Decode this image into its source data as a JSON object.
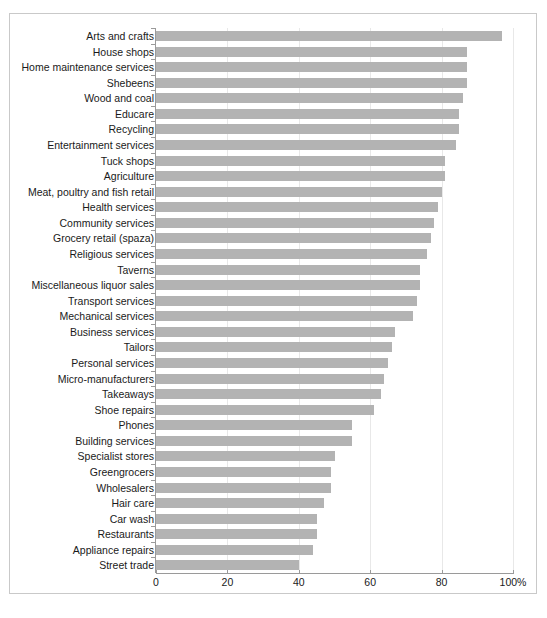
{
  "chart_data": {
    "type": "bar",
    "orientation": "horizontal",
    "title": "",
    "subtitle": "",
    "xlabel": "",
    "ylabel": "",
    "xlim": [
      0,
      100
    ],
    "grid": true,
    "legend": null,
    "bar_color": "#b3b3b3",
    "axis_color": "#9a9a9a",
    "gridline_color": "#e8e8e8",
    "frame_color": "#c9c9c9",
    "xticks": [
      {
        "value": 0,
        "label": "0"
      },
      {
        "value": 20,
        "label": "20"
      },
      {
        "value": 40,
        "label": "40"
      },
      {
        "value": 60,
        "label": "60"
      },
      {
        "value": 80,
        "label": "80"
      },
      {
        "value": 100,
        "label": "100%"
      }
    ],
    "categories": [
      "Arts and crafts",
      "House shops",
      "Home maintenance services",
      "Shebeens",
      "Wood and coal",
      "Educare",
      "Recycling",
      "Entertainment services",
      "Tuck shops",
      "Agriculture",
      "Meat, poultry and fish retail",
      "Health services",
      "Community services",
      "Grocery retail (spaza)",
      "Religious services",
      "Taverns",
      "Miscellaneous liquor sales",
      "Transport services",
      "Mechanical services",
      "Business services",
      "Tailors",
      "Personal services",
      "Micro-manufacturers",
      "Takeaways",
      "Shoe repairs",
      "Phones",
      "Building services",
      "Specialist stores",
      "Greengrocers",
      "Wholesalers",
      "Hair care",
      "Car wash",
      "Restaurants",
      "Appliance repairs",
      "Street trade"
    ],
    "values": [
      97,
      87,
      87,
      87,
      86,
      85,
      85,
      84,
      81,
      81,
      80,
      79,
      78,
      77,
      76,
      74,
      74,
      73,
      72,
      67,
      66,
      65,
      64,
      63,
      61,
      55,
      55,
      50,
      49,
      49,
      47,
      45,
      45,
      44,
      40
    ]
  }
}
